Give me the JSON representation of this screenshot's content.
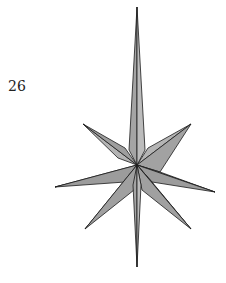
{
  "figure": {
    "label": "26",
    "shape": "eight-pointed-star",
    "fill": "#a8a8a8",
    "stroke": "#1a1a1a"
  }
}
